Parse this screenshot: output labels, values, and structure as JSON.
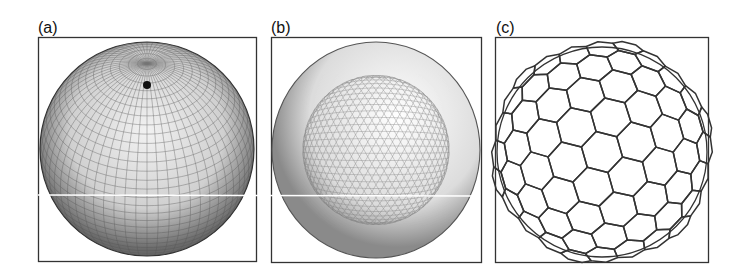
{
  "figure": {
    "panels": [
      {
        "id": "a",
        "label": "(a)",
        "mesh": "latitude-longitude quadrilateral grid sphere",
        "x": 38,
        "y": 37,
        "w": 218,
        "h": 224
      },
      {
        "id": "b",
        "label": "(b)",
        "mesh": "triangulated icosahedral sphere",
        "x": 271,
        "y": 37,
        "w": 210,
        "h": 225
      },
      {
        "id": "c",
        "label": "(c)",
        "mesh": "hexagonal (Voronoi) cell sphere",
        "x": 495,
        "y": 37,
        "w": 213,
        "h": 225
      }
    ]
  },
  "colors": {
    "frame": "#333333",
    "mesh_dark": "#222222",
    "mesh_light": "#bdbdbd",
    "background": "#ffffff"
  }
}
